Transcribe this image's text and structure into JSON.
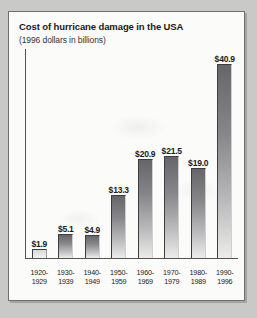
{
  "chart_data": {
    "type": "bar",
    "title": "Cost of hurricane damage in the USA",
    "subtitle": "(1996 dollars in billions)",
    "xlabel": "",
    "ylabel": "",
    "ylim": [
      0,
      44
    ],
    "grid": false,
    "legend": false,
    "units": "1996 dollars in billions",
    "categories": [
      "1920-1929",
      "1930-1939",
      "1940-1949",
      "1950-1959",
      "1960-1969",
      "1970-1979",
      "1980-1989",
      "1990-1996"
    ],
    "category_lines": [
      [
        "1920-",
        "1929"
      ],
      [
        "1930-",
        "1939"
      ],
      [
        "1940-",
        "1949"
      ],
      [
        "1950-",
        "1959"
      ],
      [
        "1960-",
        "1969"
      ],
      [
        "1970-",
        "1979"
      ],
      [
        "1980-",
        "1989"
      ],
      [
        "1990-",
        "1996"
      ]
    ],
    "values": [
      1.9,
      5.1,
      4.9,
      13.3,
      20.9,
      21.5,
      19.0,
      40.9
    ],
    "data_labels": [
      "$1.9",
      "$5.1",
      "$4.9",
      "$13.3",
      "$20.9",
      "$21.5",
      "$19.0",
      "$40.9"
    ],
    "colors": {
      "bar_dark": "#66666a",
      "bar_light": "#ececec",
      "bar_outline": "#3d3d3d",
      "axis": "#555555",
      "panel_background": "#fbfbfa",
      "page_background": "#c9c9c7",
      "text": "#1a1a1a"
    }
  }
}
